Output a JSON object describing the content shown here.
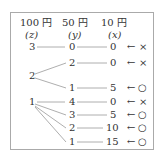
{
  "headers": [
    {
      "label": "100 円",
      "var": "(z)"
    },
    {
      "label": "50 円",
      "var": "(y)"
    },
    {
      "label": "10 円",
      "var": "(x)"
    }
  ],
  "rows": [
    {
      "z": "3",
      "y": "0",
      "x": "0",
      "mark": "×"
    },
    {
      "z": "",
      "y": "2",
      "x": "0",
      "mark": "×"
    },
    {
      "z": "2",
      "y": "",
      "x": "",
      "mark": ""
    },
    {
      "z": "",
      "y": "1",
      "x": "5",
      "mark": "○"
    },
    {
      "z": "1",
      "y": "4",
      "x": "0",
      "mark": "×"
    },
    {
      "z": "",
      "y": "3",
      "x": "5",
      "mark": "○"
    },
    {
      "z": "",
      "y": "2",
      "x": "10",
      "mark": "○"
    },
    {
      "z": "",
      "y": "1",
      "x": "15",
      "mark": "○"
    }
  ],
  "arrow": "←",
  "colors": {
    "line": "#999999",
    "text": "#333333",
    "border": "#aaaaaa"
  }
}
